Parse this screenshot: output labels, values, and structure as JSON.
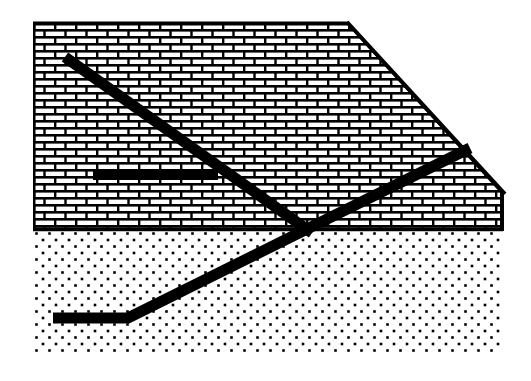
{
  "figure": {
    "type": "geological-cross-section-diagram",
    "title": "",
    "caption": "",
    "width": 531,
    "height": 381,
    "background_color": "#ffffff",
    "ink_color": "#000000"
  },
  "colors": {
    "ink": "#000000",
    "background": "#ffffff",
    "brick_fill": "#ffffff",
    "brick_mortar": "#000000",
    "stipple_dot": "#000000",
    "fault_line": "#000000"
  },
  "layers": [
    {
      "id": "upper-unit",
      "name": "Upper rock unit",
      "pattern": "brick-masonry",
      "lithology_symbol": "limestone",
      "fill_color": "#ffffff",
      "line_color": "#000000",
      "brick_width": 21,
      "brick_height": 14,
      "mortar_thickness": 3,
      "outline": [
        [
          33,
          22
        ],
        [
          348,
          22
        ],
        [
          503,
          192
        ],
        [
          503,
          230
        ],
        [
          33,
          230
        ]
      ]
    },
    {
      "id": "lower-unit",
      "name": "Lower rock unit",
      "pattern": "stipple-dots",
      "lithology_symbol": "sandstone",
      "fill_color": "#ffffff",
      "dot_color": "#000000",
      "dot_size": 2.6,
      "dot_spacing_x": 13,
      "dot_spacing_y": 6.5,
      "outline": [
        [
          33,
          230
        ],
        [
          503,
          230
        ],
        [
          503,
          355
        ],
        [
          33,
          355
        ]
      ]
    }
  ],
  "boundaries": [
    {
      "id": "layer-contact",
      "name": "Contact between upper and lower units",
      "from": [
        33,
        229
      ],
      "to": [
        503,
        229
      ],
      "stroke_width": 3
    },
    {
      "id": "top-edge",
      "name": "Top surface of upper unit",
      "from": [
        33,
        23
      ],
      "to": [
        348,
        23
      ],
      "stroke_width": 3
    },
    {
      "id": "bevel-edge",
      "name": "Beveled upper-right edge",
      "from": [
        348,
        22
      ],
      "to": [
        505,
        194
      ],
      "stroke_width": 3
    },
    {
      "id": "right-edge",
      "name": "Right edge of upper unit",
      "from": [
        503,
        192
      ],
      "to": [
        503,
        230
      ],
      "stroke_width": 3
    }
  ],
  "structures": [
    {
      "id": "normal-fault",
      "name": "Descending fault trace",
      "label": "",
      "stroke_width": 11,
      "points": [
        [
          65,
          57
        ],
        [
          312,
          233
        ]
      ]
    },
    {
      "id": "thrust-fault",
      "name": "Ascending fault trace",
      "label": "",
      "stroke_width": 11,
      "points": [
        [
          53,
          318
        ],
        [
          128,
          318
        ],
        [
          470,
          148
        ]
      ]
    },
    {
      "id": "bedding-plane",
      "name": "Horizontal bedding marker",
      "label": "",
      "stroke_width": 10,
      "points": [
        [
          93,
          175
        ],
        [
          218,
          175
        ]
      ]
    }
  ],
  "annotations": {
    "labels": [],
    "legend": []
  }
}
